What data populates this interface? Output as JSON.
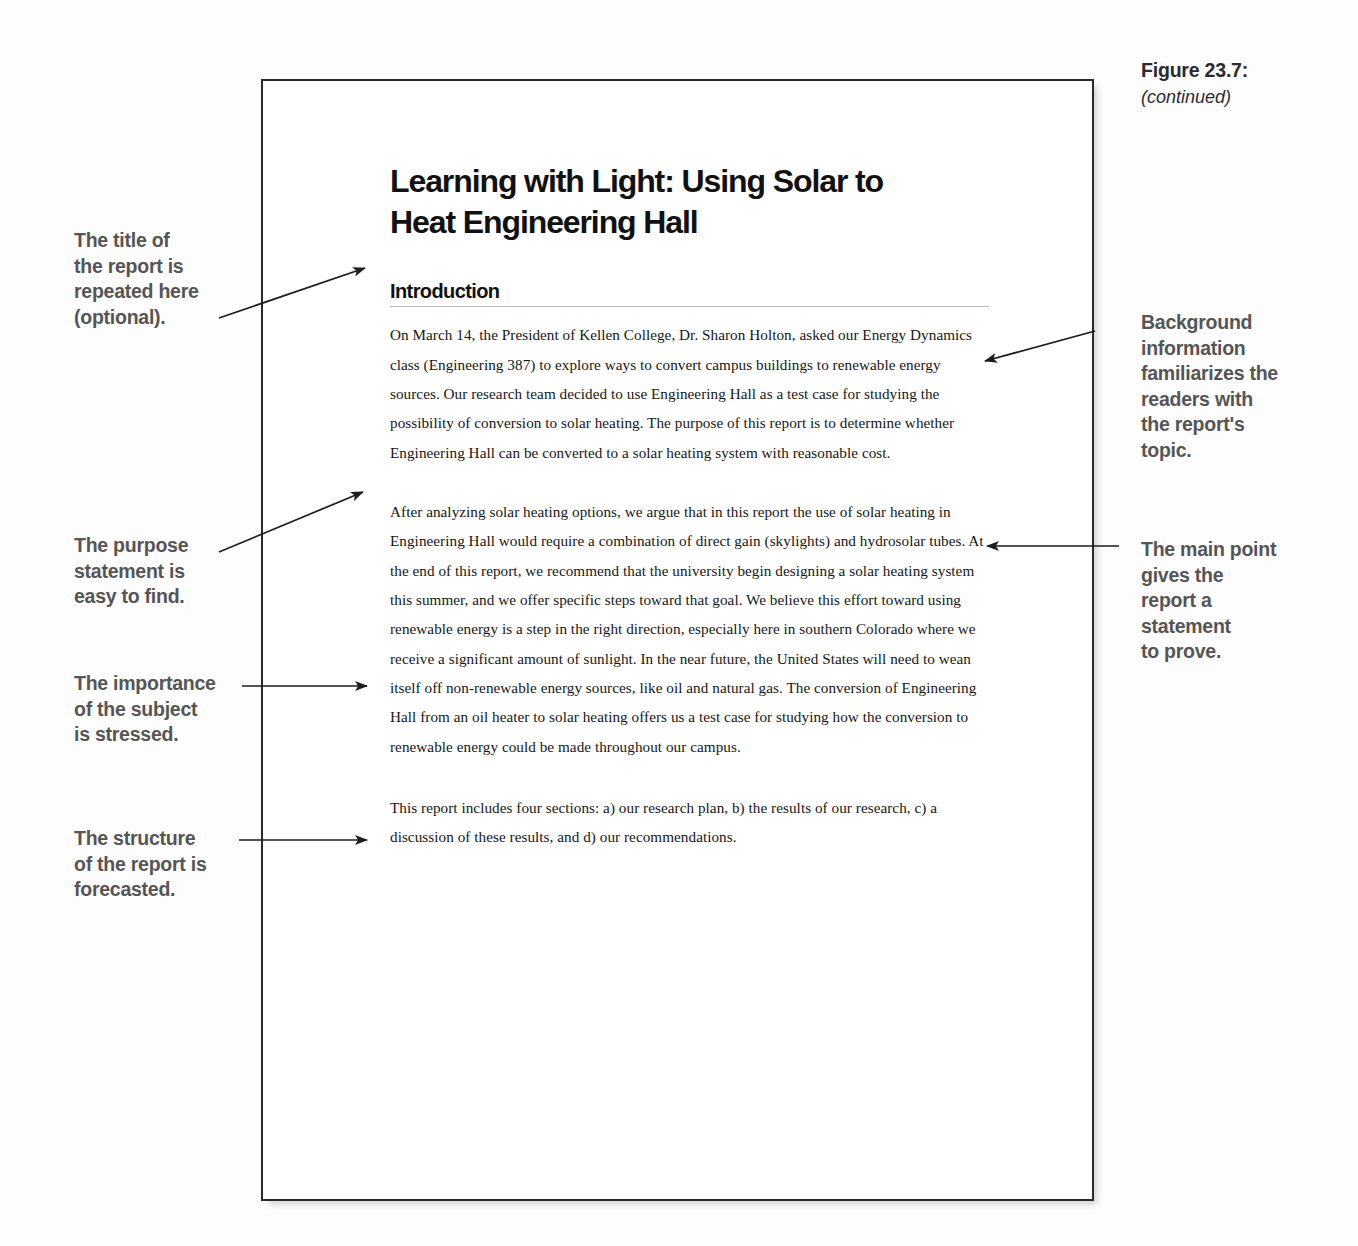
{
  "figure": {
    "label": "Figure 23.7:",
    "continued": "(continued)"
  },
  "document": {
    "title": "Learning with Light: Using Solar to Heat Engineering Hall",
    "section_heading": "Introduction",
    "paragraphs": [
      "On March 14, the President of Kellen College, Dr. Sharon Holton, asked our Energy Dynamics class (Engineering 387) to explore ways to convert campus buildings to renewable energy sources. Our research team decided to use Engineering Hall as a test case for studying the possibility of conversion to solar heating.  The purpose of this report is to determine whether Engineering Hall can be converted to a solar heating system with reasonable cost.",
      "After analyzing solar heating options, we argue that in this report the use of solar heating in Engineering Hall would require a combination of direct gain (skylights) and hydrosolar tubes. At the end of this report, we recommend that the university begin designing a solar heating system this summer, and we offer specific steps toward that goal. We believe this effort toward using renewable energy is a step in the right direction, especially here in southern Colorado where we receive a significant amount of sunlight. In the near future, the United States will need to wean itself off non-renewable energy sources, like oil and natural gas. The conversion of Engineering Hall  from an oil heater to solar heating offers us a test case for studying how the conversion to renewable energy could be made throughout our campus.",
      "This report includes four sections: a) our research plan, b) the results of our research, c) a discussion of these results, and d) our recommendations."
    ]
  },
  "annotations": {
    "left": [
      {
        "id": "title",
        "text": "The title of\nthe report is\nrepeated here\n(optional)."
      },
      {
        "id": "purpose",
        "text": "The purpose\nstatement is\neasy to find."
      },
      {
        "id": "importance",
        "text": "The importance\nof the subject\nis stressed."
      },
      {
        "id": "structure",
        "text": "The structure\nof the report is\nforecasted."
      }
    ],
    "right": [
      {
        "id": "background",
        "text": "Background\ninformation\nfamiliarizes the\nreaders with\nthe report's\ntopic."
      },
      {
        "id": "mainpoint",
        "text": "The main point\ngives the\nreport a\nstatement\nto prove."
      }
    ]
  },
  "colors": {
    "annotation_text": "#555555",
    "document_text": "#161616",
    "page_border": "#2a2a2a",
    "rule_line": "#b9b9b9",
    "background": "#fdfdfd"
  }
}
